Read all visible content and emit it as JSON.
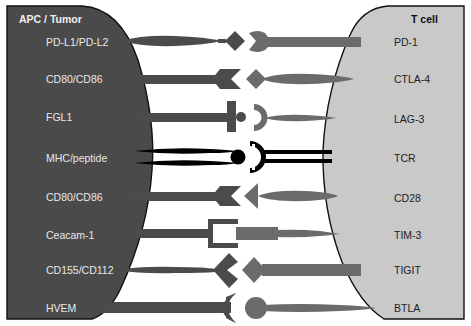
{
  "diagram": {
    "left_cell": {
      "title": "APC / Tumor",
      "fill": "#4a4a4a"
    },
    "right_cell": {
      "title": "T cell",
      "fill": "#c9c9c9"
    },
    "colors": {
      "ligand": "#4b4b4b",
      "receptor": "#6b6b6b",
      "mhc_tcr": "#000000",
      "outline": "#111111"
    },
    "pairs": [
      {
        "ligand": "PD-L1/PD-L2",
        "receptor": "PD-1"
      },
      {
        "ligand": "CD80/CD86",
        "receptor": "CTLA-4"
      },
      {
        "ligand": "FGL1",
        "receptor": "LAG-3"
      },
      {
        "ligand": "MHC/peptide",
        "receptor": "TCR"
      },
      {
        "ligand": "CD80/CD86",
        "receptor": "CD28"
      },
      {
        "ligand": "Ceacam-1",
        "receptor": "TIM-3"
      },
      {
        "ligand": "CD155/CD112",
        "receptor": "TIGIT"
      },
      {
        "ligand": "HVEM",
        "receptor": "BTLA"
      }
    ]
  }
}
